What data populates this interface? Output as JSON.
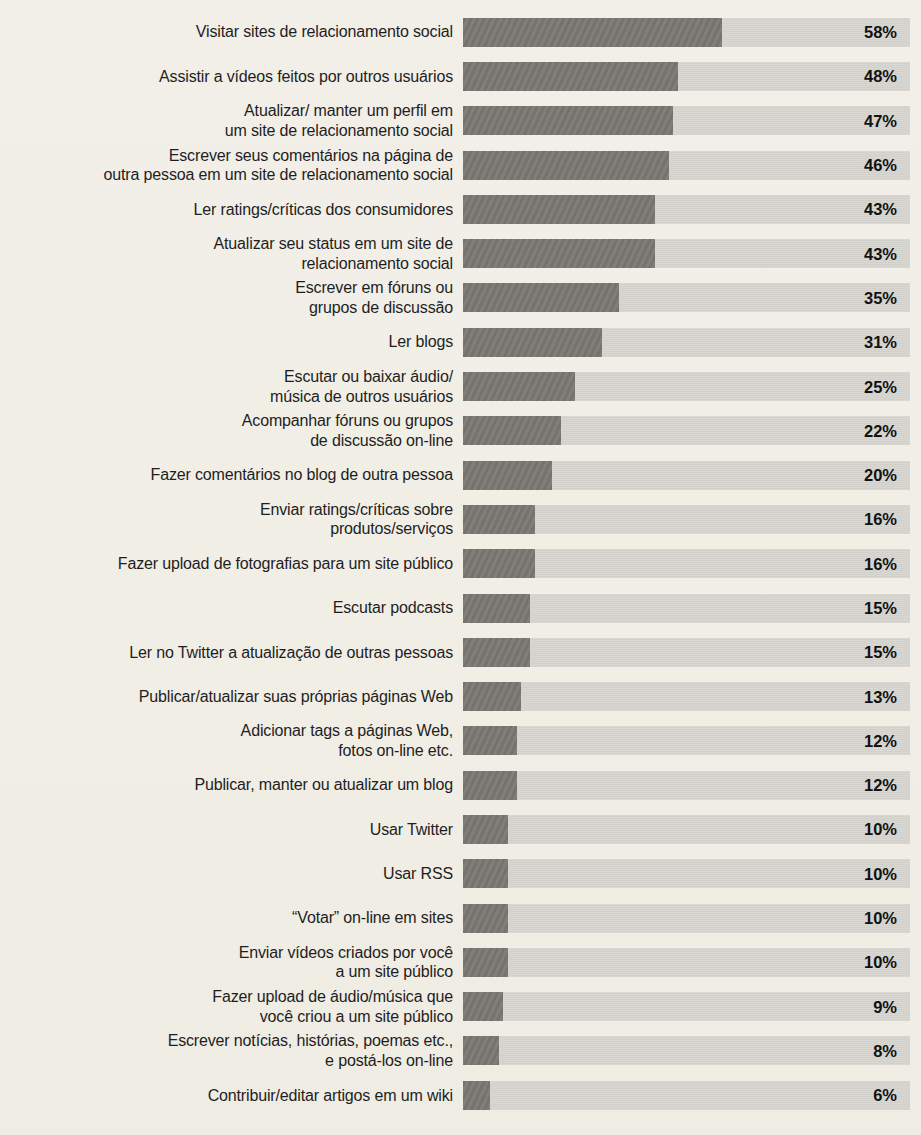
{
  "chart_data": {
    "type": "bar",
    "orientation": "horizontal",
    "title": "",
    "xlabel": "",
    "ylabel": "",
    "unit": "%",
    "xlim": [
      0,
      100
    ],
    "grid": false,
    "legend": "none",
    "value_label_position": "inside-track-right",
    "colors": {
      "background": "#f1eee7",
      "bar_track": "#d6d5cf",
      "bar_fill": "#7a7973",
      "label_text": "#1e1e1e",
      "value_text": "#111111"
    },
    "categories": [
      "Visitar sites de relacionamento social",
      "Assistir a vídeos feitos por outros usuários",
      "Atualizar/ manter um perfil em\num site de relacionamento social",
      "Escrever seus comentários na página de\noutra pessoa em um site de relacionamento social",
      "Ler ratings/críticas dos consumidores",
      "Atualizar seu status em um site de\nrelacionamento social",
      "Escrever em fóruns ou\ngrupos de discussão",
      "Ler blogs",
      "Escutar ou baixar áudio/\nmúsica de outros usuários",
      "Acompanhar fóruns ou grupos\nde discussão on-line",
      "Fazer comentários no blog de outra pessoa",
      "Enviar ratings/críticas sobre\nprodutos/serviços",
      "Fazer upload de fotografias para um site público",
      "Escutar podcasts",
      "Ler no Twitter a atualização de outras pessoas",
      "Publicar/atualizar suas próprias páginas Web",
      "Adicionar tags a páginas Web,\nfotos on-line etc.",
      "Publicar, manter ou atualizar um blog",
      "Usar Twitter",
      "Usar RSS",
      "“Votar” on-line em sites",
      "Enviar vídeos criados por você\na um site público",
      "Fazer upload de áudio/música que\nvocê criou a um site público",
      "Escrever notícias, histórias, poemas etc.,\ne postá-los on-line",
      "Contribuir/editar artigos em um wiki"
    ],
    "values": [
      58,
      48,
      47,
      46,
      43,
      43,
      35,
      31,
      25,
      22,
      20,
      16,
      16,
      15,
      15,
      13,
      12,
      12,
      10,
      10,
      10,
      10,
      9,
      8,
      6
    ],
    "value_labels": [
      "58%",
      "48%",
      "47%",
      "46%",
      "43%",
      "43%",
      "35%",
      "31%",
      "25%",
      "22%",
      "20%",
      "16%",
      "16%",
      "15%",
      "15%",
      "13%",
      "12%",
      "12%",
      "10%",
      "10%",
      "10%",
      "10%",
      "9%",
      "8%",
      "6%"
    ]
  }
}
